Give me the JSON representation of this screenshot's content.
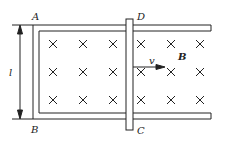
{
  "diagram": {
    "type": "physics-circuit-rails-in-magnetic-field",
    "labels": {
      "A": "A",
      "B": "B",
      "C": "C",
      "D": "D",
      "length": "l",
      "velocity": "v",
      "field": "B"
    },
    "field_symbol": "×",
    "field_marks": [
      [
        53,
        44
      ],
      [
        83,
        44
      ],
      [
        113,
        44
      ],
      [
        141,
        44
      ],
      [
        171,
        44
      ],
      [
        200,
        44
      ],
      [
        53,
        72
      ],
      [
        83,
        72
      ],
      [
        113,
        72
      ],
      [
        141,
        72
      ],
      [
        171,
        72
      ],
      [
        200,
        72
      ],
      [
        53,
        100
      ],
      [
        83,
        100
      ],
      [
        113,
        100
      ],
      [
        141,
        100
      ],
      [
        171,
        100
      ],
      [
        200,
        100
      ]
    ],
    "colors": {
      "line": "#222222",
      "background": "#ffffff"
    }
  }
}
